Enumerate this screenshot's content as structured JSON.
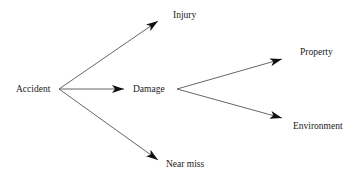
{
  "diagram": {
    "type": "tree",
    "colors": {
      "line": "#555555",
      "arrowhead": "#111111",
      "text": "#1a1a1a",
      "background": "#ffffff"
    },
    "nodes": {
      "accident": {
        "label": "Accident",
        "x": 16,
        "y": 85
      },
      "injury": {
        "label": "Injury",
        "x": 173,
        "y": 11
      },
      "damage": {
        "label": "Damage",
        "x": 133,
        "y": 85
      },
      "near_miss": {
        "label": "Near miss",
        "x": 166,
        "y": 160
      },
      "property": {
        "label": "Property",
        "x": 300,
        "y": 48
      },
      "environment": {
        "label": "Environment",
        "x": 293,
        "y": 122
      }
    },
    "edges": [
      {
        "from": "Accident",
        "to": "Injury",
        "x1": 59,
        "y1": 89,
        "x2": 158,
        "y2": 21
      },
      {
        "from": "Accident",
        "to": "Damage",
        "x1": 59,
        "y1": 89,
        "x2": 124,
        "y2": 89
      },
      {
        "from": "Accident",
        "to": "Near miss",
        "x1": 59,
        "y1": 89,
        "x2": 158,
        "y2": 160
      },
      {
        "from": "Damage",
        "to": "Property",
        "x1": 177,
        "y1": 89,
        "x2": 282,
        "y2": 59
      },
      {
        "from": "Damage",
        "to": "Environment",
        "x1": 177,
        "y1": 89,
        "x2": 282,
        "y2": 118
      }
    ]
  }
}
